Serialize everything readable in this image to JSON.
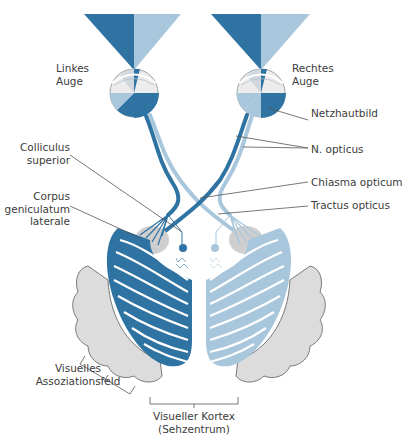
{
  "colors": {
    "dark_blue": "#2f73a3",
    "light_blue": "#a9c7dc",
    "cortex_gray": "#dcdcdc",
    "cortex_outline": "#7a7a7a",
    "leader_line": "#555555",
    "text": "#3c3c3c"
  },
  "labels": {
    "left_eye": [
      "Linkes",
      "Auge"
    ],
    "right_eye": [
      "Rechtes",
      "Auge"
    ],
    "retinal_image": "Netzhautbild",
    "optic_nerve": "N. opticus",
    "optic_chiasm": "Chiasma opticum",
    "optic_tract": "Tractus opticus",
    "superior_colliculus": [
      "Colliculus",
      "superior"
    ],
    "lateral_geniculate": [
      "Corpus",
      "geniculatum",
      "laterale"
    ],
    "association_area": [
      "Visuelles",
      "Assoziationsfeld"
    ],
    "visual_cortex": [
      "Visueller Kortex",
      "(Sehzentrum)"
    ]
  }
}
